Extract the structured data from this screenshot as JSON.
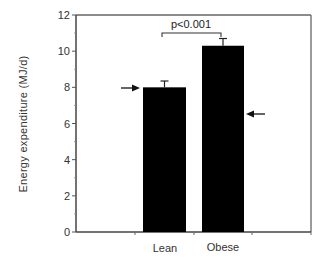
{
  "chart_data": {
    "type": "bar",
    "title": "",
    "xlabel": "",
    "ylabel": "Energy  expenditure  (MJ/d)",
    "ylim": [
      0,
      12
    ],
    "yticks": [
      0,
      2,
      4,
      6,
      8,
      10,
      12
    ],
    "categories": [
      "Lean",
      "Obese"
    ],
    "values": [
      8.0,
      10.3
    ],
    "error_bars": [
      0.35,
      0.4
    ],
    "bar_color": "#000000",
    "grid": false,
    "legend": null,
    "annotations": [
      {
        "type": "significance_bracket",
        "between": [
          "Lean",
          "Obese"
        ],
        "text": "p<0.001"
      },
      {
        "type": "arrow",
        "direction": "right",
        "target": "Lean",
        "y_value": 7.9
      },
      {
        "type": "arrow",
        "direction": "left",
        "target": "Obese",
        "y_value": 6.5
      }
    ]
  },
  "labels": {
    "ylabel": "Energy  expenditure  (MJ/d)",
    "significance": "p<0.001",
    "categories": [
      "Lean",
      "Obese"
    ],
    "yticks": [
      "0",
      "2",
      "4",
      "6",
      "8",
      "10",
      "12"
    ]
  }
}
